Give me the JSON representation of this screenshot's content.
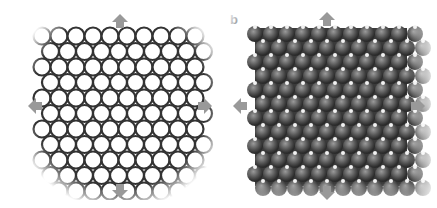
{
  "figure": {
    "panels": [
      {
        "label": "a",
        "description": "honeycomb lattice (bond framework)",
        "rows": 10,
        "cols": 9,
        "arrows": [
          "up",
          "down",
          "left",
          "right"
        ]
      },
      {
        "label": "b",
        "description": "space-filling atomic lattice",
        "rows": 10,
        "cols": 10,
        "arrows": [
          "up",
          "down",
          "left",
          "right"
        ]
      }
    ],
    "colors": {
      "arrow": "#999999",
      "bond": "#333333",
      "atom_dark": "#3a3a3a",
      "atom_light": "#f2f2f2"
    }
  }
}
